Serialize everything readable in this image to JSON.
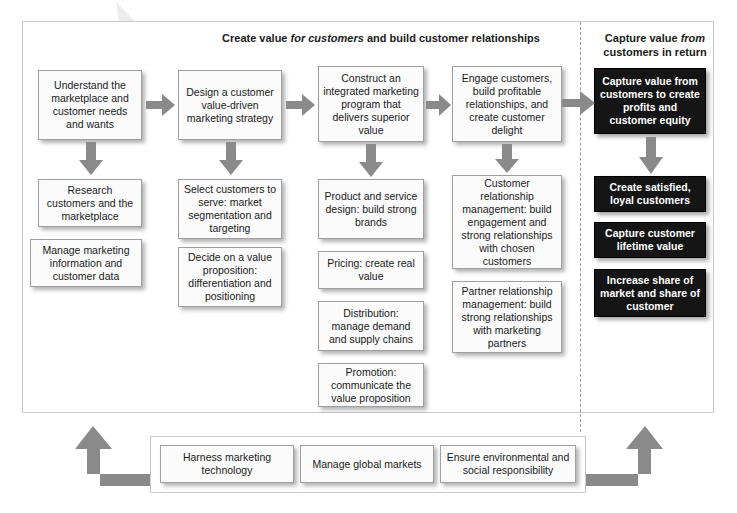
{
  "headers": {
    "left": {
      "line1_a": "Create value ",
      "line1_it": "for customers",
      "line1_b": " and",
      "line2": "build customer relationships"
    },
    "right": {
      "line1_a": "Capture value ",
      "line1_it": "from",
      "line2_a": "customers",
      "line2_b": " in return"
    }
  },
  "columns": [
    {
      "id": "understand",
      "boxes": [
        {
          "name": "box-understand-marketplace",
          "text": "Understand the marketplace and customer needs and wants"
        },
        {
          "name": "box-research-customers",
          "text": "Research customers and the marketplace"
        },
        {
          "name": "box-manage-marketing-information",
          "text": "Manage marketing information and customer data"
        }
      ]
    },
    {
      "id": "design-strategy",
      "boxes": [
        {
          "name": "box-design-strategy",
          "text": "Design a customer value-driven marketing strategy"
        },
        {
          "name": "box-select-customers",
          "text": "Select customers to serve: market segmentation and targeting"
        },
        {
          "name": "box-value-proposition",
          "text": "Decide on a value proposition: differentiation and positioning"
        }
      ]
    },
    {
      "id": "integrated-program",
      "boxes": [
        {
          "name": "box-construct-program",
          "text": "Construct an integrated marketing program that delivers superior value"
        },
        {
          "name": "box-product-service-design",
          "text": "Product and service design: build strong brands"
        },
        {
          "name": "box-pricing",
          "text": "Pricing: create real value"
        },
        {
          "name": "box-distribution",
          "text": "Distribution: manage demand and supply chains"
        },
        {
          "name": "box-promotion",
          "text": "Promotion: communicate the value proposition"
        }
      ]
    },
    {
      "id": "engage-customers",
      "boxes": [
        {
          "name": "box-engage-customers",
          "text": "Engage customers, build profitable relationships, and create customer delight"
        },
        {
          "name": "box-customer-relationship-management",
          "text": "Customer relationship management: build engagement and strong relationships with chosen customers"
        },
        {
          "name": "box-partner-relationship-management",
          "text": "Partner relationship management: build strong relationships with marketing partners"
        }
      ]
    },
    {
      "id": "capture-value",
      "boxes": [
        {
          "name": "box-capture-value",
          "text": "Capture value from customers to create profits and customer equity"
        },
        {
          "name": "box-create-satisfied-customers",
          "text": "Create satisfied, loyal customers"
        },
        {
          "name": "box-capture-lifetime-value",
          "text": "Capture customer lifetime value"
        },
        {
          "name": "box-increase-share",
          "text": "Increase share of market and share of customer"
        }
      ]
    }
  ],
  "bottom_boxes": [
    {
      "name": "box-harness-technology",
      "text": "Harness marketing technology"
    },
    {
      "name": "box-manage-global-markets",
      "text": "Manage global markets"
    },
    {
      "name": "box-social-responsibility",
      "text": "Ensure environmental and social responsibility"
    }
  ],
  "colors": {
    "arrow_gray": "#8a8a8a",
    "dark_box": "#151515",
    "box_fill": "#fbfbfb",
    "frame_border": "#c9c9c9"
  }
}
